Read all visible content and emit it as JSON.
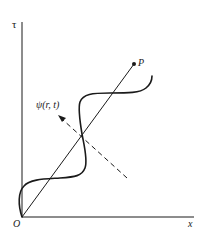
{
  "figure": {
    "axes": {
      "y_label": "τ",
      "x_label": "x",
      "origin_label": "O"
    },
    "point": {
      "label": "P"
    },
    "wave_label": "ψ(r, t)",
    "colors": {
      "ink": "#1a1a1a",
      "background": "#ffffff"
    }
  }
}
